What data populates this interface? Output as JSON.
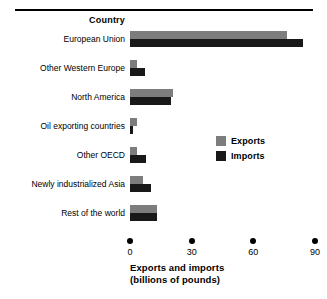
{
  "chart_data": {
    "type": "bar",
    "orientation": "horizontal",
    "title": "",
    "column_header": "Country",
    "xlabel_line1": "Exports and imports",
    "xlabel_line2": "(billions of pounds)",
    "ylabel": "Country",
    "xlim": [
      0,
      90
    ],
    "xticks": [
      0,
      30,
      60,
      90
    ],
    "xtick_labels": [
      "0",
      "30",
      "60",
      "90"
    ],
    "grid": false,
    "legend_position": "middle-right",
    "categories": [
      "European Union",
      "Other Western Europe",
      "North America",
      "Oil exporting countries",
      "Other OECD",
      "Newly industrialized Asia",
      "Rest of the world"
    ],
    "series": [
      {
        "name": "Exports",
        "color": "#7d7d7d",
        "values": [
          76.5,
          3.6,
          21,
          3.6,
          3.6,
          6.3,
          13
        ]
      },
      {
        "name": "Imports",
        "color": "#191919",
        "values": [
          84,
          7.3,
          20,
          1.6,
          7.8,
          10,
          13
        ]
      }
    ]
  },
  "legend": {
    "items": [
      {
        "label": "Exports",
        "swatch": "exports"
      },
      {
        "label": "Imports",
        "swatch": "imports"
      }
    ]
  }
}
